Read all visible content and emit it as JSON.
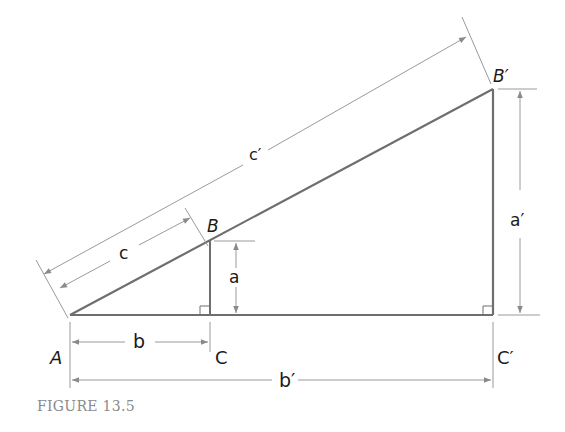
{
  "figure": {
    "caption": "FIGURE 13.5"
  },
  "vertices": {
    "A": {
      "label": "A",
      "x": 70,
      "y": 315
    },
    "B": {
      "label": "B",
      "x": 210,
      "y": 241
    },
    "C": {
      "label": "C",
      "x": 210,
      "y": 315
    },
    "B_prime": {
      "label": "B′",
      "x": 493,
      "y": 89
    },
    "C_prime": {
      "label": "C′",
      "x": 493,
      "y": 315
    }
  },
  "dimensions": {
    "a": "a",
    "b": "b",
    "c": "c",
    "a_prime": "a′",
    "b_prime": "b′",
    "c_prime": "c′"
  },
  "colors": {
    "triangle_stroke": "#6e6e6e",
    "dimension_stroke": "#9a9a9a",
    "label": "#1a1a1a",
    "caption": "#8a8a8a"
  }
}
